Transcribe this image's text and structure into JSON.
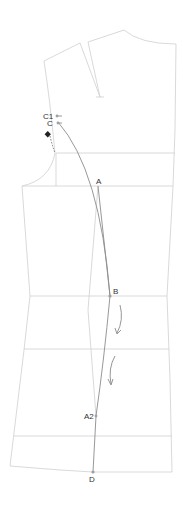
{
  "diagram": {
    "colors": {
      "outline": "#c8c8c8",
      "construction": "#888888",
      "arrow": "#8a8a8a",
      "marker": "#222222",
      "point": "#999999"
    },
    "labels": {
      "c1": "C1",
      "c": "C",
      "a": "A",
      "b": "B",
      "a2": "A2",
      "d": "D"
    },
    "icons": [
      "diamond-marker",
      "curved-arrow",
      "curved-arrow"
    ]
  }
}
